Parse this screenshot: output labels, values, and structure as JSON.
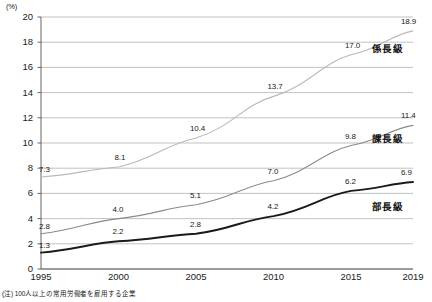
{
  "chart_data": {
    "type": "line",
    "title": "",
    "subtitle": "",
    "xlabel": "",
    "ylabel": "",
    "unit_label": "(%)",
    "categories": [
      "1995",
      "2000",
      "2005",
      "2010",
      "2015",
      "2019"
    ],
    "x": [
      1995,
      2000,
      2005,
      2010,
      2015,
      2019
    ],
    "ylim": [
      0,
      20
    ],
    "y_ticks": [
      "0",
      "2",
      "4",
      "6",
      "8",
      "10",
      "12",
      "14",
      "16",
      "18",
      "20"
    ],
    "grid": true,
    "legend_position": "right-inline",
    "series": [
      {
        "name": "係長級",
        "color": "#b9b9b9",
        "values": [
          7.3,
          8.1,
          10.4,
          13.7,
          17.0,
          18.9
        ],
        "labels": [
          "7.3",
          "8.1",
          "10.4",
          "13.7",
          "17.0",
          "18.9"
        ]
      },
      {
        "name": "課長級",
        "color": "#8a8a8a",
        "values": [
          2.8,
          4.0,
          5.1,
          7.0,
          9.8,
          11.4
        ],
        "labels": [
          "2.8",
          "4.0",
          "5.1",
          "7.0",
          "9.8",
          "11.4"
        ]
      },
      {
        "name": "部長級",
        "color": "#1a1a1a",
        "values": [
          1.3,
          2.2,
          2.8,
          4.2,
          6.2,
          6.9
        ],
        "labels": [
          "1.3",
          "2.2",
          "2.8",
          "4.2",
          "6.2",
          "6.9"
        ]
      }
    ],
    "annotations": {
      "footnote": "(注) 100人以上の常用労働者を雇用する企業"
    },
    "colors": {
      "grid": "#a8a8a8",
      "axis": "#555555",
      "text": "#1a1a1a"
    }
  }
}
